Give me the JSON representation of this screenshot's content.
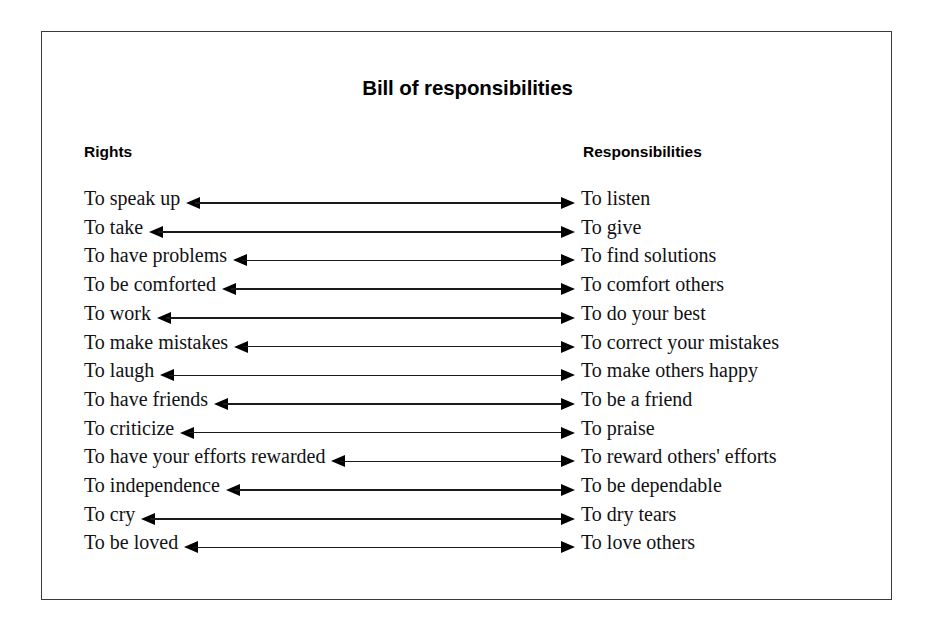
{
  "figure": {
    "title": "Bill of responsibilities",
    "border_color": "#3a3a3e",
    "background_color": "#ffffff",
    "text_color": "#111114",
    "arrow_color": "#000000"
  },
  "columns": {
    "left_header": "Rights",
    "right_header": "Responsibilities"
  },
  "pairs": [
    {
      "right": "To speak up",
      "responsibility": "To listen"
    },
    {
      "right": "To take",
      "responsibility": "To give"
    },
    {
      "right": "To have problems",
      "responsibility": "To find solutions"
    },
    {
      "right": "To be comforted",
      "responsibility": "To comfort others"
    },
    {
      "right": "To work",
      "responsibility": "To do your best"
    },
    {
      "right": "To make mistakes",
      "responsibility": "To correct your mistakes"
    },
    {
      "right": "To laugh",
      "responsibility": "To make others happy"
    },
    {
      "right": "To have friends",
      "responsibility": "To be a friend"
    },
    {
      "right": "To criticize",
      "responsibility": "To praise"
    },
    {
      "right": "To have your efforts rewarded",
      "responsibility": "To reward others' efforts"
    },
    {
      "right": "To independence",
      "responsibility": "To be dependable"
    },
    {
      "right": "To cry",
      "responsibility": "To dry tears"
    },
    {
      "right": "To be loved",
      "responsibility": "To love others"
    }
  ]
}
